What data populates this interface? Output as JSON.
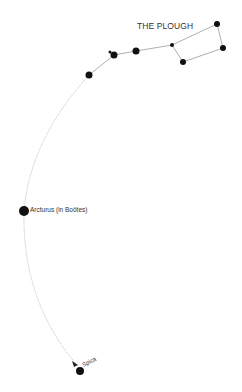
{
  "diagram": {
    "title": "THE PLOUGH",
    "colors": {
      "star": "#111111",
      "line": "#999999",
      "arc": "#aaaaaa",
      "text": "#333333"
    },
    "labels": {
      "arcturus": "Arcturus (in Boötes)",
      "spica": "Spica"
    },
    "plough_stars": [
      {
        "name": "star-alkaid",
        "x": 89,
        "y": 75,
        "r": 3.5
      },
      {
        "name": "star-alcor",
        "x": 110,
        "y": 52,
        "r": 1.5
      },
      {
        "name": "star-mizar",
        "x": 114,
        "y": 55,
        "r": 3.5
      },
      {
        "name": "star-alioth",
        "x": 136,
        "y": 51,
        "r": 3.5
      },
      {
        "name": "star-megrez",
        "x": 172,
        "y": 45,
        "r": 2
      },
      {
        "name": "star-phecda",
        "x": 183,
        "y": 62,
        "r": 3
      },
      {
        "name": "star-merak",
        "x": 223,
        "y": 48,
        "r": 3
      },
      {
        "name": "star-dubhe",
        "x": 217,
        "y": 24,
        "r": 3
      }
    ],
    "other_stars": [
      {
        "name": "star-arcturus",
        "x": 24,
        "y": 211,
        "r": 5
      },
      {
        "name": "star-spica",
        "x": 80,
        "y": 371,
        "r": 4
      }
    ]
  }
}
